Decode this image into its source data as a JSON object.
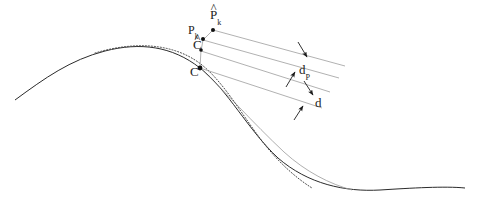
{
  "figure": {
    "type": "technical-diagram"
  },
  "labels": {
    "p_hat_k": {
      "base": "P",
      "sub": "k",
      "hat": "^",
      "text": "P̂ₖ",
      "x": 210,
      "y": 8
    },
    "p_k": {
      "base": "P",
      "sub": "k",
      "hat": "",
      "text": "Pₖ",
      "x": 188,
      "y": 24
    },
    "c_hat": {
      "base": "C",
      "sub": "",
      "hat": "^",
      "text": "Ĉ",
      "x": 193,
      "y": 38
    },
    "c": {
      "base": "C",
      "sub": "",
      "hat": "",
      "text": "C",
      "x": 190,
      "y": 65
    },
    "d_p": {
      "base": "d",
      "sub": "P",
      "hat": "",
      "text": "dₚ",
      "x": 299,
      "y": 63
    },
    "d": {
      "base": "d",
      "sub": "",
      "hat": "",
      "text": "d",
      "x": 315,
      "y": 96
    }
  },
  "curves": {
    "true_curve": {
      "name": "solid-curve",
      "style": "solid",
      "color": "#2b2b2b",
      "width": 1.0,
      "path": "M 15,100 C 45,78 70,60 105,51 C 140,42 172,46 200,68 C 228,90 248,130 278,158 C 308,184 345,192 380,190 C 412,188 445,186 465,188"
    },
    "approx_curve": {
      "name": "dotted-curve",
      "style": "dotted",
      "color": "#4a4a4a",
      "width": 1.0,
      "path": "M 95,53 C 128,43 168,41 198,62 C 222,79 240,112 262,141 C 278,162 296,178 312,188"
    },
    "aux_curve": {
      "name": "auxiliary-thin-curve",
      "style": "solid",
      "color": "#9a9a9a",
      "width": 0.8,
      "path": "M 200,68 C 226,92 252,122 284,152 C 306,172 330,184 352,190"
    }
  },
  "points": [
    {
      "name": "point-p-hat-k",
      "x": 213,
      "y": 30,
      "r": 2.0
    },
    {
      "name": "point-p-k",
      "x": 203,
      "y": 39,
      "r": 2.0
    },
    {
      "name": "point-c-hat",
      "x": 201,
      "y": 50,
      "r": 1.8
    },
    {
      "name": "point-c",
      "x": 200,
      "y": 68,
      "r": 2.4
    }
  ],
  "dimension_lines": [
    {
      "name": "leader-p-hat-k",
      "x1": 213,
      "y1": 30,
      "x2": 345,
      "y2": 66
    },
    {
      "name": "leader-p-k",
      "x1": 203,
      "y1": 40,
      "x2": 339,
      "y2": 78
    },
    {
      "name": "leader-c-hat",
      "x1": 201,
      "y1": 51,
      "x2": 330,
      "y2": 92
    },
    {
      "name": "leader-c",
      "x1": 200,
      "y1": 68,
      "x2": 322,
      "y2": 108
    },
    {
      "name": "extension-c-to-c-hat",
      "x1": 200,
      "y1": 68,
      "x2": 201,
      "y2": 50
    },
    {
      "name": "extension-p-k-to-p-hat-k",
      "x1": 203,
      "y1": 40,
      "x2": 213,
      "y2": 30
    },
    {
      "name": "extension-c-hat-to-p-k",
      "x1": 201,
      "y1": 51,
      "x2": 203,
      "y2": 40
    }
  ],
  "arrows": [
    {
      "name": "arrow-d-p-upper",
      "x1": 298,
      "y1": 42,
      "x2": 307,
      "y2": 57,
      "label": "d_p"
    },
    {
      "name": "arrow-d-p-lower",
      "x1": 286,
      "y1": 87,
      "x2": 295,
      "y2": 72,
      "label": "d_p"
    },
    {
      "name": "arrow-d-upper",
      "x1": 304,
      "y1": 81,
      "x2": 313,
      "y2": 95,
      "label": "d"
    },
    {
      "name": "arrow-d-lower",
      "x1": 294,
      "y1": 120,
      "x2": 303,
      "y2": 106,
      "label": "d"
    }
  ],
  "colors": {
    "ink": "#1c1c1c",
    "curve": "#2b2b2b",
    "light_line": "#8f8f8f",
    "background": "#ffffff"
  }
}
